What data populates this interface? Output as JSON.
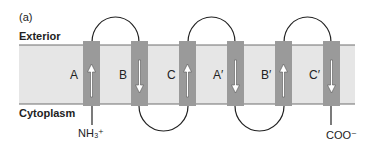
{
  "panel_label": "(a)",
  "regions": {
    "exterior": "Exterior",
    "cytoplasm": "Cytoplasm"
  },
  "termini": {
    "n_terminus": "NH₃⁺",
    "c_terminus": "COO⁻"
  },
  "colors": {
    "membrane_fill": "#e6e6e6",
    "membrane_edge": "#7a7a7a",
    "helix_fill": "#9a9a9a",
    "arrow_fill": "#ffffff",
    "arrow_stroke": "#555555",
    "loop_stroke": "#222222"
  },
  "helices": [
    {
      "label": "A",
      "direction": "up"
    },
    {
      "label": "B",
      "direction": "down"
    },
    {
      "label": "C",
      "direction": "up"
    },
    {
      "label": "A′",
      "direction": "down"
    },
    {
      "label": "B′",
      "direction": "up"
    },
    {
      "label": "C′",
      "direction": "down"
    }
  ]
}
